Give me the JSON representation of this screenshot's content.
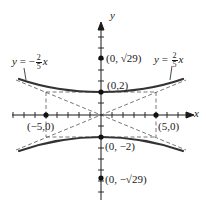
{
  "figure": {
    "type": "hyperbola",
    "equation_shape": "vertical transverse axis",
    "colors": {
      "curve": "#333333",
      "axes": "#1a1a1a",
      "dashed": "#555555",
      "background": "#ffffff"
    },
    "axes": {
      "x_label": "x",
      "y_label": "y"
    },
    "asymptotes": [
      {
        "id": "neg",
        "label_y": "y",
        "label_eq": "=",
        "label_sign": "−",
        "label_num": "2",
        "label_den": "5",
        "label_x": "x"
      },
      {
        "id": "pos",
        "label_y": "y",
        "label_eq": "=",
        "label_sign": "",
        "label_num": "2",
        "label_den": "5",
        "label_x": "x"
      }
    ],
    "points": [
      {
        "id": "focus-top",
        "label": "(0, √29)"
      },
      {
        "id": "vertex-top",
        "label": "(0,2)"
      },
      {
        "id": "co-vertex-left",
        "label": "(−5,0)"
      },
      {
        "id": "co-vertex-right",
        "label": "(5,0)"
      },
      {
        "id": "vertex-bottom",
        "label": "(0, −2)"
      },
      {
        "id": "focus-bottom",
        "label": "(0, −√29)"
      }
    ]
  }
}
